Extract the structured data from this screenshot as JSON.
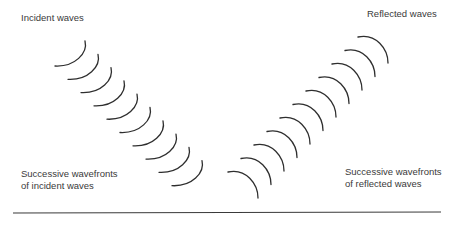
{
  "diagram": {
    "title_incident": "Incident waves",
    "title_reflected": "Reflected waves",
    "caption_incident_line1": "Successive wavefronts",
    "caption_incident_line2": "of incident waves",
    "caption_reflected_line1": "Successive wavefronts",
    "caption_reflected_line2": "of reflected waves",
    "stroke_color": "#2e2e2e",
    "surface": {
      "x1": 13,
      "y1": 213,
      "x2": 441,
      "y2": 212
    },
    "incident_wavefronts": {
      "count": 10,
      "start": [
        85,
        41
      ],
      "step": [
        13,
        13.3
      ]
    },
    "reflected_wavefronts": {
      "count": 11,
      "start": [
        358,
        37
      ],
      "step": [
        -13,
        13.5
      ]
    }
  }
}
